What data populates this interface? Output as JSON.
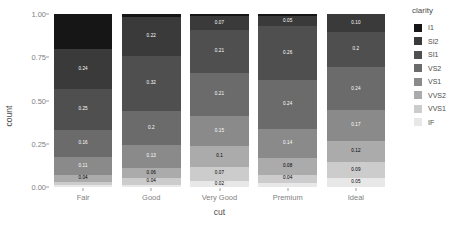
{
  "chart_data": {
    "type": "bar",
    "title": "",
    "xlabel": "cut",
    "ylabel": "count",
    "categories": [
      "Fair",
      "Good",
      "Very Good",
      "Premium",
      "Ideal"
    ],
    "ylim": [
      0,
      1
    ],
    "yticks": [
      "0.00",
      "0.25",
      "0.50",
      "0.75",
      "1.00"
    ],
    "ytick_values": [
      0,
      0.25,
      0.5,
      0.75,
      1
    ],
    "grid": false,
    "stacked": true,
    "normalized": true,
    "legend_position": "right",
    "legend_title": "clarity",
    "series": [
      {
        "name": "I1",
        "color": "#161616",
        "values": [
          0.21,
          0.02,
          0.01,
          0.01,
          0.0
        ],
        "labels": [
          "",
          "",
          "",
          "",
          ""
        ]
      },
      {
        "name": "SI2",
        "color": "#3a3a3a",
        "values": [
          0.24,
          0.22,
          0.07,
          0.05,
          0.1
        ],
        "labels": [
          "0.24",
          "0.22",
          "0.07",
          "0.05",
          "0.10"
        ]
      },
      {
        "name": "SI1",
        "color": "#4f4f4f",
        "values": [
          0.25,
          0.32,
          0.21,
          0.26,
          0.2
        ],
        "labels": [
          "0.25",
          "0.32",
          "0.21",
          "0.26",
          "0.2"
        ]
      },
      {
        "name": "VS2",
        "color": "#6b6b6b",
        "values": [
          0.16,
          0.2,
          0.21,
          0.24,
          0.24
        ],
        "labels": [
          "0.16",
          "0.2",
          "0.21",
          "0.24",
          "0.24"
        ]
      },
      {
        "name": "VS1",
        "color": "#8a8a8a",
        "values": [
          0.11,
          0.13,
          0.15,
          0.14,
          0.17
        ],
        "labels": [
          "0.11",
          "0.13",
          "0.15",
          "0.14",
          "0.17"
        ]
      },
      {
        "name": "VVS2",
        "color": "#ababab",
        "values": [
          0.04,
          0.06,
          0.1,
          0.08,
          0.12
        ],
        "labels": [
          "0.04",
          "0.06",
          "0.1",
          "0.08",
          "0.12"
        ]
      },
      {
        "name": "VVS1",
        "color": "#cccccc",
        "values": [
          0.02,
          0.04,
          0.07,
          0.04,
          0.09
        ],
        "labels": [
          "",
          "0.04",
          "0.07",
          "0.04",
          "0.09"
        ]
      },
      {
        "name": "IF",
        "color": "#e8e8e8",
        "values": [
          0.01,
          0.01,
          0.03,
          0.02,
          0.05
        ],
        "labels": [
          "",
          "",
          "0.02",
          "",
          "0.05"
        ]
      }
    ]
  },
  "axes": {
    "y_label": "count",
    "x_label": "cut"
  },
  "legend": {
    "title": "clarity",
    "items": [
      {
        "label": "I1",
        "color": "#161616"
      },
      {
        "label": "SI2",
        "color": "#3a3a3a"
      },
      {
        "label": "SI1",
        "color": "#4f4f4f"
      },
      {
        "label": "VS2",
        "color": "#6b6b6b"
      },
      {
        "label": "VS1",
        "color": "#8a8a8a"
      },
      {
        "label": "VVS2",
        "color": "#ababab"
      },
      {
        "label": "VVS1",
        "color": "#cccccc"
      },
      {
        "label": "IF",
        "color": "#e8e8e8"
      }
    ]
  },
  "colors": {
    "background": "#ffffff",
    "axis_text": "#7f7f7f",
    "axis_title": "#4d4d4d",
    "tick_mark": "#a0a0a0",
    "label_dark": "#000000",
    "label_light": "#ffffff"
  }
}
